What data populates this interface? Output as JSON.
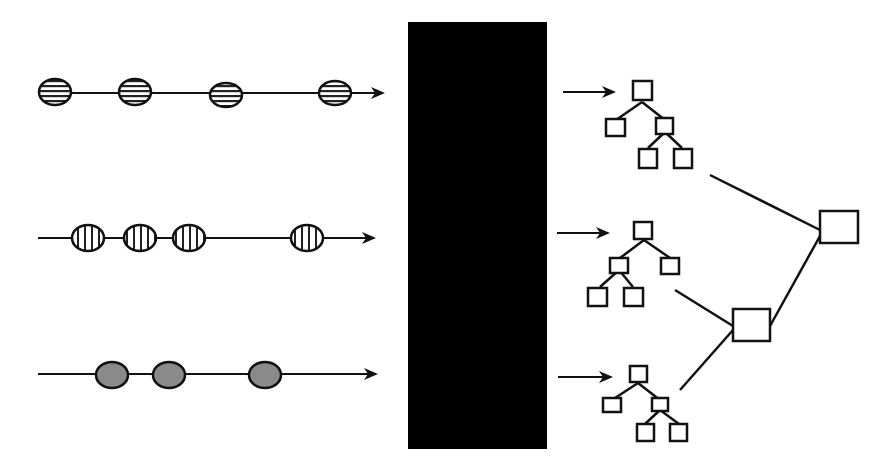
{
  "diagram": {
    "title": "",
    "colors": {
      "stroke": "#111111",
      "black_box": "#000000",
      "gray_fill": "#8a8a8a",
      "background": "#ffffff"
    },
    "sequences": [
      {
        "id": "sequence-horizontal-hatch",
        "pattern": "horizontal-hatch",
        "y": 93,
        "x_start": 38,
        "x_end": 385,
        "events_x": [
          55,
          135,
          226,
          335
        ]
      },
      {
        "id": "sequence-vertical-hatch",
        "pattern": "vertical-hatch",
        "y": 238,
        "x_start": 38,
        "x_end": 376,
        "events_x": [
          88,
          140,
          189,
          307
        ]
      },
      {
        "id": "sequence-gray-fill",
        "pattern": "gray-fill",
        "y": 376,
        "x_start": 38,
        "x_end": 378,
        "events_x": [
          112,
          169,
          265
        ]
      }
    ],
    "black_box": {
      "x": 408,
      "y": 22,
      "width": 139,
      "height": 427,
      "label": ""
    },
    "trees": [
      {
        "id": "tree-1",
        "arrow_y": 92,
        "arrow_x_start": 563,
        "arrow_x_end": 615
      },
      {
        "id": "tree-2",
        "arrow_y": 233,
        "arrow_x_start": 557,
        "arrow_x_end": 610
      },
      {
        "id": "tree-3",
        "arrow_y": 377,
        "arrow_x_start": 558,
        "arrow_x_end": 612
      }
    ],
    "combiners": [
      {
        "id": "combiner-lower",
        "x": 733,
        "y": 309,
        "width": 37,
        "height": 32
      },
      {
        "id": "combiner-top",
        "x": 820,
        "y": 211,
        "width": 38,
        "height": 32
      }
    ]
  }
}
